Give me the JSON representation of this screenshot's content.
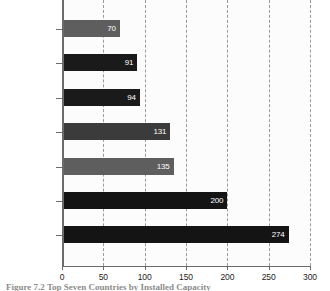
{
  "chart_data": {
    "type": "bar",
    "orientation": "horizontal",
    "title": "",
    "subtitle": "",
    "xlabel": "",
    "ylabel": "",
    "xlim": [
      0,
      300
    ],
    "xticks": [
      0,
      50,
      100,
      150,
      200,
      250,
      300
    ],
    "xtick_labels": [
      "0",
      "50",
      "100",
      "150",
      "200",
      "250",
      "300"
    ],
    "grid": "vertical-dashed",
    "legend": "none",
    "categories": [
      "Argentina",
      "Australia",
      "India",
      "Russia",
      "Brazil",
      "South Korea",
      "China"
    ],
    "values": [
      70,
      91,
      94,
      131,
      135,
      200,
      274
    ],
    "value_labels": [
      "70",
      "91",
      "94",
      "131",
      "135",
      "200",
      "274"
    ],
    "bar_colors": [
      "#5e5e5e",
      "#1a1a1a",
      "#1a1a1a",
      "#3b3b3b",
      "#5e5e5e",
      "#141414",
      "#141414"
    ],
    "bars": [
      {
        "category": "Argentina",
        "value": 70,
        "label": "70",
        "color": "#5e5e5e"
      },
      {
        "category": "Australia",
        "value": 91,
        "label": "91",
        "color": "#1a1a1a"
      },
      {
        "category": "India",
        "value": 94,
        "label": "94",
        "color": "#1a1a1a"
      },
      {
        "category": "Russia",
        "value": 131,
        "label": "131",
        "color": "#3b3b3b"
      },
      {
        "category": "Brazil",
        "value": 135,
        "label": "135",
        "color": "#5e5e5e"
      },
      {
        "category": "South Korea",
        "value": 200,
        "label": "200",
        "color": "#141414"
      },
      {
        "category": "China",
        "value": 274,
        "label": "274",
        "color": "#141414"
      }
    ]
  },
  "caption": {
    "partial_text": "Figure 7.2  Top Seven Countries by Installed Capacity",
    "visible": "cut-off"
  },
  "colors": {
    "axis": "#6b6b6b",
    "grid": "#9a9a9a",
    "plot_background": "#fcfcfc",
    "page_background": "#ffffff",
    "label_text": "#1c1c1c",
    "value_text": "#ffffff"
  }
}
